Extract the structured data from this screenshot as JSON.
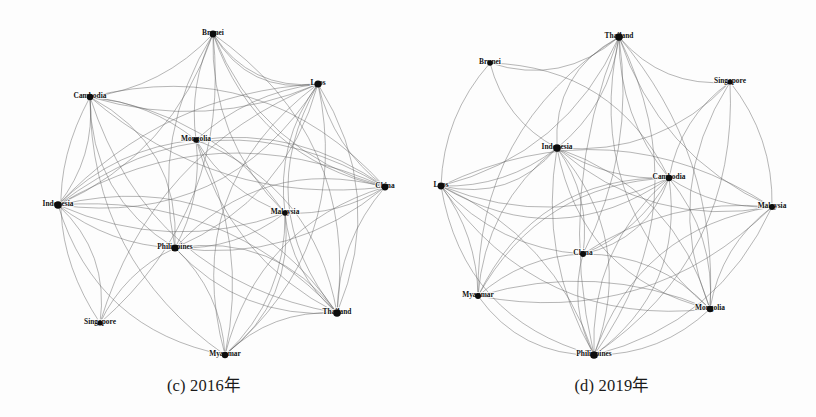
{
  "figure": {
    "background_color": "#fdfdfd",
    "edge_color": "#5d5d5d",
    "node_color": "#0d0d0d"
  },
  "chart_data": {
    "type": "diagram",
    "subtype": "network-graph",
    "title": "",
    "panels": [
      {
        "id": "c",
        "caption": "(c) 2016年",
        "year": "2016",
        "nodes": [
          {
            "id": "Brunei",
            "label": "Brunei",
            "x": 213,
            "y": 34,
            "r": 3.4,
            "label_dx": 0,
            "label_dy": -1
          },
          {
            "id": "Cambodia",
            "label": "Cambodia",
            "x": 90,
            "y": 97,
            "r": 3.2,
            "label_dx": 0,
            "label_dy": -1
          },
          {
            "id": "Laos",
            "label": "Laos",
            "x": 318,
            "y": 84,
            "r": 3.6,
            "label_dx": 0,
            "label_dy": -1
          },
          {
            "id": "Mongolia",
            "label": "Mongolia",
            "x": 196,
            "y": 140,
            "r": 2.8,
            "label_dx": 0,
            "label_dy": -1
          },
          {
            "id": "China",
            "label": "China",
            "x": 385,
            "y": 187,
            "r": 3.4,
            "label_dx": 0,
            "label_dy": -1
          },
          {
            "id": "Indonesia",
            "label": "Indonesia",
            "x": 58,
            "y": 205,
            "r": 3.8,
            "label_dx": 0,
            "label_dy": -1
          },
          {
            "id": "Malaysia",
            "label": "Malaysia",
            "x": 285,
            "y": 213,
            "r": 2.8,
            "label_dx": 0,
            "label_dy": -1
          },
          {
            "id": "Philippines",
            "label": "Philippines",
            "x": 175,
            "y": 248,
            "r": 3.6,
            "label_dx": 0,
            "label_dy": -1
          },
          {
            "id": "Thailand",
            "label": "Thailand",
            "x": 337,
            "y": 313,
            "r": 3.8,
            "label_dx": 0,
            "label_dy": -1
          },
          {
            "id": "Singapore",
            "label": "Singapore",
            "x": 100,
            "y": 323,
            "r": 2.6,
            "label_dx": 0,
            "label_dy": -1
          },
          {
            "id": "Myanmar",
            "label": "Myanmar",
            "x": 225,
            "y": 355,
            "r": 3.2,
            "label_dx": 0,
            "label_dy": -1
          }
        ],
        "edges": [
          [
            "Brunei",
            "Laos",
            0.3
          ],
          [
            "Brunei",
            "Indonesia",
            -0.22
          ],
          [
            "Brunei",
            "Philippines",
            0.2
          ],
          [
            "Brunei",
            "Cambodia",
            -0.18
          ],
          [
            "Brunei",
            "China",
            0.25
          ],
          [
            "Brunei",
            "Thailand",
            -0.3
          ],
          [
            "Brunei",
            "Mongolia",
            0.15
          ],
          [
            "Brunei",
            "Malaysia",
            0.22
          ],
          [
            "Cambodia",
            "Laos",
            0.18
          ],
          [
            "Cambodia",
            "Indonesia",
            -0.2
          ],
          [
            "Cambodia",
            "Philippines",
            0.28
          ],
          [
            "Cambodia",
            "China",
            0.22
          ],
          [
            "Cambodia",
            "Thailand",
            0.3
          ],
          [
            "Cambodia",
            "Mongolia",
            -0.15
          ],
          [
            "Cambodia",
            "Myanmar",
            0.26
          ],
          [
            "Cambodia",
            "Malaysia",
            -0.22
          ],
          [
            "Laos",
            "Indonesia",
            0.2
          ],
          [
            "Laos",
            "Philippines",
            -0.24
          ],
          [
            "Laos",
            "China",
            0.18
          ],
          [
            "Laos",
            "Thailand",
            -0.26
          ],
          [
            "Laos",
            "Mongolia",
            0.16
          ],
          [
            "Laos",
            "Malaysia",
            0.2
          ],
          [
            "Laos",
            "Myanmar",
            -0.3
          ],
          [
            "Laos",
            "Singapore",
            0.24
          ],
          [
            "Mongolia",
            "Indonesia",
            0.18
          ],
          [
            "Mongolia",
            "Philippines",
            -0.16
          ],
          [
            "Mongolia",
            "China",
            -0.2
          ],
          [
            "Mongolia",
            "Thailand",
            0.22
          ],
          [
            "Mongolia",
            "Malaysia",
            0.18
          ],
          [
            "Mongolia",
            "Myanmar",
            -0.18
          ],
          [
            "China",
            "Indonesia",
            0.26
          ],
          [
            "China",
            "Philippines",
            -0.22
          ],
          [
            "China",
            "Thailand",
            0.18
          ],
          [
            "China",
            "Malaysia",
            -0.16
          ],
          [
            "China",
            "Myanmar",
            0.28
          ],
          [
            "Indonesia",
            "Philippines",
            0.16
          ],
          [
            "Indonesia",
            "Thailand",
            -0.24
          ],
          [
            "Indonesia",
            "Malaysia",
            0.2
          ],
          [
            "Indonesia",
            "Myanmar",
            0.3
          ],
          [
            "Indonesia",
            "Singapore",
            -0.26
          ],
          [
            "Malaysia",
            "Philippines",
            -0.18
          ],
          [
            "Malaysia",
            "Thailand",
            0.2
          ],
          [
            "Malaysia",
            "Myanmar",
            -0.22
          ],
          [
            "Philippines",
            "Thailand",
            0.24
          ],
          [
            "Philippines",
            "Myanmar",
            -0.2
          ],
          [
            "Philippines",
            "Singapore",
            0.18
          ],
          [
            "Thailand",
            "Myanmar",
            0.22
          ],
          [
            "Brunei",
            "Singapore",
            -0.26
          ],
          [
            "Cambodia",
            "Singapore",
            0.3
          ],
          [
            "Laos",
            "Brunei",
            -0.34
          ],
          [
            "China",
            "Brunei",
            -0.28
          ],
          [
            "Thailand",
            "Indonesia",
            0.34
          ],
          [
            "Laos",
            "Indonesia",
            -0.32
          ],
          [
            "China",
            "Philippines",
            0.3
          ],
          [
            "Myanmar",
            "Malaysia",
            0.28
          ],
          [
            "Cambodia",
            "China",
            -0.3
          ],
          [
            "Laos",
            "Thailand",
            0.34
          ],
          [
            "Indonesia",
            "China",
            -0.34
          ],
          [
            "Philippines",
            "Thailand",
            -0.3
          ],
          [
            "Mongolia",
            "Thailand",
            -0.28
          ],
          [
            "Cambodia",
            "Philippines",
            -0.32
          ],
          [
            "Laos",
            "Myanmar",
            0.34
          ]
        ]
      },
      {
        "id": "d",
        "caption": "(d) 2019年",
        "year": "2019",
        "nodes": [
          {
            "id": "Thailand",
            "label": "Thailand",
            "x": 211,
            "y": 37,
            "r": 3.8,
            "label_dx": 0,
            "label_dy": -1
          },
          {
            "id": "Brunei",
            "label": "Brunei",
            "x": 82,
            "y": 63,
            "r": 2.8,
            "label_dx": 0,
            "label_dy": -1
          },
          {
            "id": "Singapore",
            "label": "Singapore",
            "x": 322,
            "y": 82,
            "r": 2.6,
            "label_dx": 0,
            "label_dy": -1
          },
          {
            "id": "Indonesia",
            "label": "Indonesia",
            "x": 149,
            "y": 148,
            "r": 3.8,
            "label_dx": 0,
            "label_dy": -1
          },
          {
            "id": "Cambodia",
            "label": "Cambodia",
            "x": 261,
            "y": 178,
            "r": 3.2,
            "label_dx": 0,
            "label_dy": -1
          },
          {
            "id": "Laos",
            "label": "Laos",
            "x": 33,
            "y": 186,
            "r": 3.4,
            "label_dx": 0,
            "label_dy": -1
          },
          {
            "id": "Malaysia",
            "label": "Malaysia",
            "x": 364,
            "y": 207,
            "r": 3.0,
            "label_dx": 0,
            "label_dy": -1
          },
          {
            "id": "China",
            "label": "China",
            "x": 175,
            "y": 254,
            "r": 3.0,
            "label_dx": 0,
            "label_dy": -1
          },
          {
            "id": "Myanmar",
            "label": "Myanmar",
            "x": 70,
            "y": 296,
            "r": 3.0,
            "label_dx": 0,
            "label_dy": -1
          },
          {
            "id": "Mongolia",
            "label": "Mongolia",
            "x": 302,
            "y": 309,
            "r": 3.2,
            "label_dx": 0,
            "label_dy": -1
          },
          {
            "id": "Philippines",
            "label": "Philippines",
            "x": 186,
            "y": 355,
            "r": 3.8,
            "label_dx": 0,
            "label_dy": -1
          }
        ],
        "edges": [
          [
            "Thailand",
            "Brunei",
            -0.28
          ],
          [
            "Thailand",
            "Singapore",
            0.26
          ],
          [
            "Thailand",
            "Indonesia",
            -0.2
          ],
          [
            "Thailand",
            "Cambodia",
            0.18
          ],
          [
            "Thailand",
            "Laos",
            -0.24
          ],
          [
            "Thailand",
            "Malaysia",
            0.22
          ],
          [
            "Thailand",
            "China",
            -0.16
          ],
          [
            "Thailand",
            "Myanmar",
            0.28
          ],
          [
            "Thailand",
            "Mongolia",
            -0.2
          ],
          [
            "Thailand",
            "Philippines",
            0.16
          ],
          [
            "Brunei",
            "Indonesia",
            0.22
          ],
          [
            "Brunei",
            "Cambodia",
            -0.3
          ],
          [
            "Brunei",
            "Laos",
            0.18
          ],
          [
            "Singapore",
            "Indonesia",
            -0.24
          ],
          [
            "Singapore",
            "Cambodia",
            0.2
          ],
          [
            "Singapore",
            "Malaysia",
            -0.18
          ],
          [
            "Singapore",
            "Mongolia",
            0.26
          ],
          [
            "Singapore",
            "Philippines",
            -0.28
          ],
          [
            "Indonesia",
            "Cambodia",
            0.16
          ],
          [
            "Indonesia",
            "Laos",
            -0.18
          ],
          [
            "Indonesia",
            "Malaysia",
            0.24
          ],
          [
            "Indonesia",
            "China",
            -0.2
          ],
          [
            "Indonesia",
            "Myanmar",
            0.22
          ],
          [
            "Indonesia",
            "Mongolia",
            -0.26
          ],
          [
            "Indonesia",
            "Philippines",
            0.18
          ],
          [
            "Cambodia",
            "Laos",
            -0.22
          ],
          [
            "Cambodia",
            "Malaysia",
            0.16
          ],
          [
            "Cambodia",
            "China",
            -0.18
          ],
          [
            "Cambodia",
            "Myanmar",
            0.28
          ],
          [
            "Cambodia",
            "Mongolia",
            -0.2
          ],
          [
            "Cambodia",
            "Philippines",
            0.24
          ],
          [
            "Laos",
            "Malaysia",
            -0.28
          ],
          [
            "Laos",
            "China",
            0.2
          ],
          [
            "Laos",
            "Myanmar",
            -0.16
          ],
          [
            "Laos",
            "Mongolia",
            0.3
          ],
          [
            "Laos",
            "Philippines",
            -0.22
          ],
          [
            "Malaysia",
            "China",
            0.18
          ],
          [
            "Malaysia",
            "Myanmar",
            -0.26
          ],
          [
            "Malaysia",
            "Mongolia",
            0.2
          ],
          [
            "Malaysia",
            "Philippines",
            -0.24
          ],
          [
            "China",
            "Myanmar",
            0.18
          ],
          [
            "China",
            "Mongolia",
            -0.22
          ],
          [
            "China",
            "Philippines",
            0.2
          ],
          [
            "Myanmar",
            "Mongolia",
            -0.18
          ],
          [
            "Myanmar",
            "Philippines",
            0.26
          ],
          [
            "Mongolia",
            "Philippines",
            -0.2
          ],
          [
            "Thailand",
            "Indonesia",
            0.32
          ],
          [
            "Thailand",
            "Philippines",
            -0.3
          ],
          [
            "Laos",
            "Philippines",
            0.32
          ],
          [
            "Indonesia",
            "Philippines",
            -0.3
          ],
          [
            "Cambodia",
            "Philippines",
            -0.3
          ],
          [
            "Laos",
            "Cambodia",
            0.32
          ],
          [
            "Indonesia",
            "Mongolia",
            0.32
          ],
          [
            "Malaysia",
            "Philippines",
            0.3
          ],
          [
            "Thailand",
            "Mongolia",
            0.3
          ],
          [
            "Laos",
            "Indonesia",
            0.3
          ],
          [
            "China",
            "Cambodia",
            0.28
          ],
          [
            "Myanmar",
            "Cambodia",
            -0.32
          ]
        ]
      }
    ]
  }
}
